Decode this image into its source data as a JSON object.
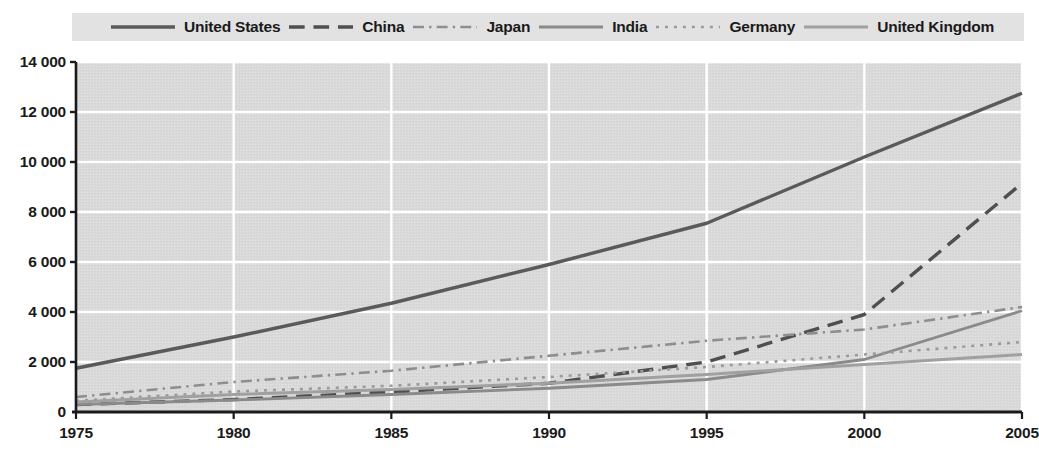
{
  "legend": {
    "position": "top",
    "items": [
      {
        "label": "United States",
        "style": "solid",
        "width": 3.4,
        "color": "#5a5a5a"
      },
      {
        "label": "China",
        "style": "dashed",
        "width": 3.4,
        "color": "#4f4f4f"
      },
      {
        "label": "Japan",
        "style": "dashdot",
        "width": 2.6,
        "color": "#8e8e8e"
      },
      {
        "label": "India",
        "style": "solid",
        "width": 2.8,
        "color": "#8a8a8a"
      },
      {
        "label": "Germany",
        "style": "dotted",
        "width": 2.6,
        "color": "#9a9a9a"
      },
      {
        "label": "United Kingdom",
        "style": "solid",
        "width": 3.0,
        "color": "#a0a0a0"
      }
    ]
  },
  "axes": {
    "y_ticks": [
      "14 000",
      "12 000",
      "10 000",
      "8 000",
      "6 000",
      "4 000",
      "2 000",
      "0"
    ],
    "y_values": [
      14000,
      12000,
      10000,
      8000,
      6000,
      4000,
      2000,
      0
    ],
    "x_ticks": [
      "1975",
      "1980",
      "1985",
      "1990",
      "1995",
      "2000",
      "2005"
    ],
    "x_values": [
      1975,
      1980,
      1985,
      1990,
      1995,
      2000,
      2005
    ],
    "ylim": [
      0,
      14000
    ],
    "xlim": [
      1975,
      2005
    ],
    "grid": true,
    "grid_color": "#ffffff",
    "plot_bg": "#d9d9d9"
  },
  "chart_data": {
    "type": "line",
    "title": "",
    "subtitle": "",
    "xlabel": "",
    "ylabel": "",
    "xlim": [
      1975,
      2005
    ],
    "ylim": [
      0,
      14000
    ],
    "grid": true,
    "legend_position": "top",
    "x": [
      1975,
      1980,
      1985,
      1990,
      1995,
      2000,
      2005
    ],
    "series": [
      {
        "name": "United States",
        "style": "solid",
        "color": "#5a5a5a",
        "width": 3.4,
        "values": [
          1750,
          3000,
          4350,
          5900,
          7550,
          10200,
          12750
        ]
      },
      {
        "name": "China",
        "style": "dashed",
        "color": "#4f4f4f",
        "width": 3.4,
        "values": [
          300,
          500,
          800,
          1150,
          2000,
          3900,
          9150
        ]
      },
      {
        "name": "Japan",
        "style": "dashdot",
        "color": "#8e8e8e",
        "width": 2.6,
        "values": [
          600,
          1200,
          1650,
          2250,
          2850,
          3300,
          4200
        ]
      },
      {
        "name": "India",
        "style": "solid",
        "color": "#8a8a8a",
        "width": 2.8,
        "values": [
          300,
          480,
          700,
          950,
          1300,
          2100,
          4050
        ]
      },
      {
        "name": "Germany",
        "style": "dotted",
        "color": "#9a9a9a",
        "width": 2.6,
        "values": [
          450,
          820,
          1050,
          1400,
          1800,
          2300,
          2800
        ]
      },
      {
        "name": "United Kingdom",
        "style": "solid",
        "color": "#a0a0a0",
        "width": 3.0,
        "values": [
          400,
          700,
          900,
          1150,
          1500,
          1900,
          2300
        ]
      }
    ]
  }
}
